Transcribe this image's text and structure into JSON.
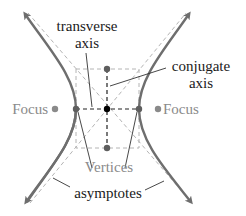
{
  "diagram": {
    "labels": {
      "transverse_axis_line1": "transverse",
      "transverse_axis_line2": "axis",
      "conjugate_axis_line1": "conjugate",
      "conjugate_axis_line2": "axis",
      "focus_left": "Focus",
      "focus_right": "Focus",
      "vertices": "Vertices",
      "asymptotes": "asymptotes"
    },
    "colors": {
      "curve": "#6e6e6e",
      "asymptote": "#b4b4b4",
      "axis_dash": "#222222",
      "box_dash": "#b4b4b4",
      "focus_point": "#8a8a8a",
      "vertex_point": "#5e5e5e",
      "center_point": "#000000",
      "label_dark": "#1a1a1a",
      "label_gray": "#8a8a8a"
    },
    "points": {
      "center": [
        107,
        109
      ],
      "vertex_left": [
        76,
        109
      ],
      "vertex_right": [
        139,
        109
      ],
      "covertex_top": [
        107,
        69
      ],
      "covertex_bottom": [
        107,
        148
      ],
      "focus_left": [
        55,
        109
      ],
      "focus_right": [
        158,
        109
      ]
    }
  }
}
